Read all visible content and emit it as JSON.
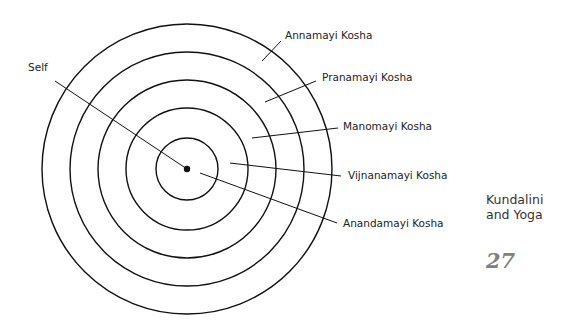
{
  "diagram": {
    "center": {
      "x": 187,
      "y": 169
    },
    "rings": [
      {
        "name": "Annamayi Kosha",
        "radius": 145
      },
      {
        "name": "Pranamayi Kosha",
        "radius": 117
      },
      {
        "name": "Manomayi Kosha",
        "radius": 89
      },
      {
        "name": "Vijnanamayi Kosha",
        "radius": 61
      },
      {
        "name": "Anandamayi Kosha",
        "radius": 31
      }
    ],
    "labels": {
      "self": "Self",
      "annamayi": "Annamayi Kosha",
      "pranamayi": "Pranamayi Kosha",
      "manomayi": "Manomayi Kosha",
      "vijnanamayi": "Vijnanamayi Kosha",
      "anandamayi": "Anandamayi Kosha"
    },
    "line_color": "#111111"
  },
  "page": {
    "section_title": "Kundalini and Yoga",
    "page_number": "27",
    "page_number_color": "#808080"
  }
}
